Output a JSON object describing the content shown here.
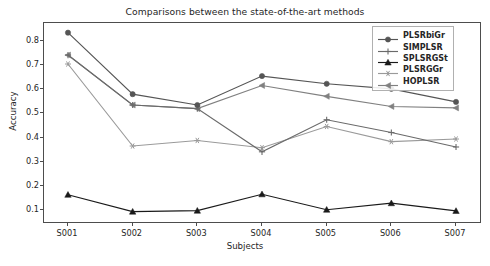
{
  "chart_data": {
    "type": "line",
    "title": "Comparisons between the state-of-the-art methods",
    "xlabel": "Subjects",
    "ylabel": "Accuracy",
    "categories": [
      "S001",
      "S002",
      "S003",
      "S004",
      "S005",
      "S006",
      "S007"
    ],
    "ylim": [
      0.05,
      0.875
    ],
    "yticks": [
      0.1,
      0.2,
      0.3,
      0.4,
      0.5,
      0.6,
      0.7,
      0.8
    ],
    "ytick_labels": [
      "0.1",
      "0.2",
      "0.3",
      "0.4",
      "0.5",
      "0.6",
      "0.7",
      "0.8"
    ],
    "grid": false,
    "legend_position": "upper right",
    "series": [
      {
        "name": "PLSRbiGr",
        "color": "#555555",
        "marker": "circle",
        "values": [
          0.835,
          0.58,
          0.535,
          0.655,
          0.623,
          0.602,
          0.548
        ]
      },
      {
        "name": "SIMPLSR",
        "color": "#6a6a6a",
        "marker": "plus",
        "values": [
          0.742,
          0.535,
          0.52,
          0.341,
          0.474,
          0.421,
          0.361
        ]
      },
      {
        "name": "SPLSRGSt",
        "color": "#1a1a1a",
        "marker": "triangle",
        "values": [
          0.163,
          0.093,
          0.097,
          0.165,
          0.101,
          0.128,
          0.096
        ]
      },
      {
        "name": "PLSRGGr",
        "color": "#9a9a9a",
        "marker": "star",
        "values": [
          0.705,
          0.365,
          0.388,
          0.358,
          0.446,
          0.383,
          0.394
        ]
      },
      {
        "name": "HOPLSR",
        "color": "#808080",
        "marker": "left-triangle",
        "values": [
          0.742,
          0.535,
          0.52,
          0.616,
          0.571,
          0.529,
          0.523
        ]
      }
    ]
  }
}
